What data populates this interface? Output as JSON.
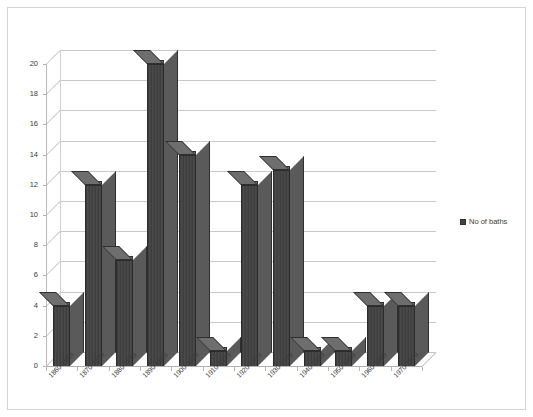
{
  "chart_data": {
    "type": "bar",
    "title": "",
    "subtitle": "",
    "xlabel": "",
    "ylabel": "",
    "categories": [
      "1860-1869",
      "1870-1879",
      "1880-1889",
      "1890-1899",
      "1900-1909",
      "1910-1919",
      "1920-1929",
      "1930-1939",
      "1940-1949",
      "1950-1959",
      "1960-1969",
      "1970-1979"
    ],
    "series": [
      {
        "name": "No of baths",
        "values": [
          4,
          12,
          7,
          20,
          14,
          1,
          12,
          13,
          1,
          1,
          4,
          4
        ],
        "color": "#444444"
      }
    ],
    "ylim": [
      0,
      20
    ],
    "yticks": [
      0,
      2,
      4,
      6,
      8,
      10,
      12,
      14,
      16,
      18,
      20
    ],
    "ytick_labels": [
      "0",
      "2",
      "4",
      "6",
      "8",
      "10",
      "12",
      "14",
      "16",
      "18",
      "20"
    ],
    "grid": true,
    "grid_axis": "y",
    "legend_position": "right",
    "three_d": true,
    "plot_background": "#ffffff",
    "grid_color": "#c9c9c9",
    "axis_color": "#b0b0b0",
    "border_color": "#d4d4d4"
  },
  "legend": {
    "entries": [
      {
        "label": "No of baths",
        "color": "#444444"
      }
    ]
  }
}
